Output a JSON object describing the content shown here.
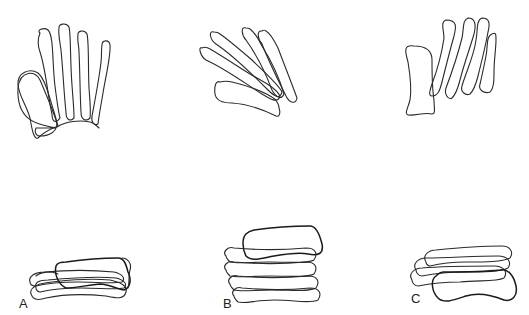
{
  "figure": {
    "stroke_color": "#2a2a2a",
    "background_color": "#ffffff",
    "panels": [
      {
        "id": "A",
        "label": "A",
        "upper_view": "fanned metacarpals with thumb metacarpal to the left",
        "lower_view": "flattened stack, heavy-outlined bone on top"
      },
      {
        "id": "B",
        "label": "B",
        "upper_view": "metacarpals converging diagonally",
        "lower_view": "tall stack of four bones, heavy-outlined bone on top"
      },
      {
        "id": "C",
        "label": "C",
        "upper_view": "parallel tilted metacarpals with thumb metacarpal separate",
        "lower_view": "stack with heavy-outlined bone at bottom"
      }
    ]
  }
}
